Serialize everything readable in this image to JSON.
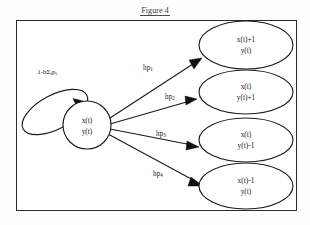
{
  "figure": {
    "title": "Figure 4",
    "caption_position": "top-center"
  },
  "colors": {
    "frame_border": "#2b2b2b",
    "node_stroke": "#1c1c1c",
    "node_fill": "#ffffff",
    "text": "#1a1a1a",
    "background": "#ffffff"
  },
  "diagram": {
    "type": "state-transition-diagram",
    "center_node": {
      "id": "center",
      "shape": "circle",
      "line1": "x(t)",
      "line2": "y(t)"
    },
    "self_loop": {
      "id": "self-loop",
      "label_main": "1-h",
      "label_sigma": "Σ",
      "label_sigma_sub": "i",
      "label_p": "p",
      "label_p_sub": "i",
      "label_full": "1-hΣᵢpᵢ",
      "direction": "returns-to-center"
    },
    "target_nodes": [
      {
        "id": "node-1",
        "shape": "ellipse",
        "line1": "x(t)+1",
        "line2": "y(t)"
      },
      {
        "id": "node-2",
        "shape": "ellipse",
        "line1": "x(t)",
        "line2": "y(t)+1"
      },
      {
        "id": "node-3",
        "shape": "ellipse",
        "line1": "x(t)",
        "line2": "y(t)-1"
      },
      {
        "id": "node-4",
        "shape": "ellipse",
        "line1": "x(t)-1",
        "line2": "y(t)"
      }
    ],
    "edges": [
      {
        "id": "edge-1",
        "label_base": "hp",
        "label_sub": "1",
        "label_full": "hp₁",
        "from": "center",
        "to": "node-1"
      },
      {
        "id": "edge-2",
        "label_base": "hp",
        "label_sub": "2",
        "label_full": "hp₂",
        "from": "center",
        "to": "node-2"
      },
      {
        "id": "edge-3",
        "label_base": "hp",
        "label_sub": "3",
        "label_full": "hp₃",
        "from": "center",
        "to": "node-3"
      },
      {
        "id": "edge-4",
        "label_base": "hp",
        "label_sub": "4",
        "label_full": "hp₄",
        "from": "center",
        "to": "node-4"
      }
    ]
  }
}
